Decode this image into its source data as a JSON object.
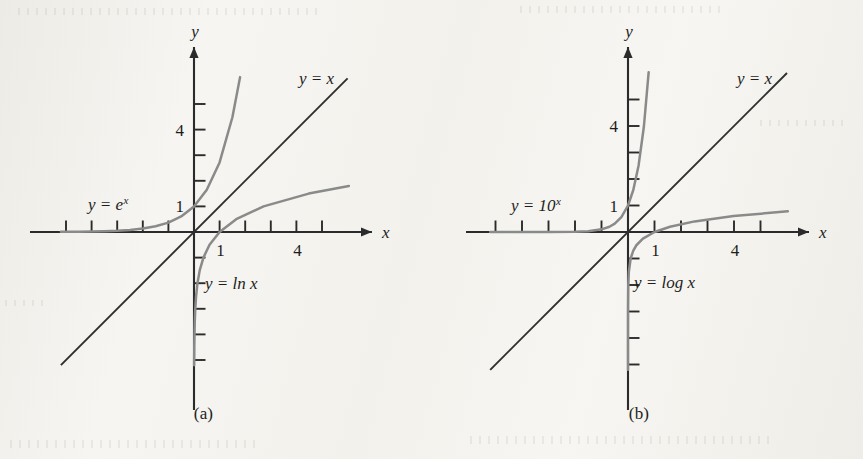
{
  "figure": {
    "colors": {
      "axis": "#2b2b2b",
      "identity_line": "#2f2f2f",
      "curve": "#8a8a8a",
      "text": "#1d1d1d",
      "paper": "#f7f6f2"
    }
  },
  "panels": [
    {
      "id": "a",
      "caption": "(a)",
      "axes": {
        "x_label": "x",
        "y_label": "y",
        "x_ticks": [
          -5,
          -4,
          -3,
          -2,
          -1,
          1,
          2,
          3,
          4,
          5
        ],
        "y_ticks": [
          -5,
          -4,
          -3,
          -2,
          -1,
          1,
          2,
          3,
          4,
          5
        ],
        "x_tick_labels": [
          {
            "value": 1,
            "text": "1"
          },
          {
            "value": 4,
            "text": "4"
          }
        ],
        "y_tick_labels": [
          {
            "value": 1,
            "text": "1"
          },
          {
            "value": 4,
            "text": "4"
          }
        ],
        "xlim": [
          -5.2,
          6.9
        ],
        "ylim": [
          -7.3,
          7.3
        ],
        "grid": false
      },
      "annotations": [
        {
          "name": "identity-line-label",
          "base": "y = x",
          "sup": ""
        },
        {
          "name": "exponential-curve-label",
          "base": "y = e",
          "sup": "x"
        },
        {
          "name": "logarithm-curve-label",
          "base": "y = ln x",
          "sup": ""
        }
      ]
    },
    {
      "id": "b",
      "caption": "(b)",
      "axes": {
        "x_label": "x",
        "y_label": "y",
        "x_ticks": [
          -5,
          -4,
          -3,
          -2,
          -1,
          1,
          2,
          3,
          4,
          5
        ],
        "y_ticks": [
          -5,
          -4,
          -3,
          -2,
          -1,
          1,
          2,
          3,
          4,
          5
        ],
        "x_tick_labels": [
          {
            "value": 1,
            "text": "1"
          },
          {
            "value": 4,
            "text": "4"
          }
        ],
        "y_tick_labels": [
          {
            "value": 1,
            "text": "1"
          },
          {
            "value": 4,
            "text": "4"
          }
        ],
        "xlim": [
          -5.2,
          6.9
        ],
        "ylim": [
          -7.3,
          7.3
        ],
        "grid": false
      },
      "annotations": [
        {
          "name": "identity-line-label",
          "base": "y = x",
          "sup": ""
        },
        {
          "name": "exponential-curve-label",
          "base": "y = 10",
          "sup": "x"
        },
        {
          "name": "logarithm-curve-label",
          "base": "y = log x",
          "sup": ""
        }
      ]
    }
  ],
  "chart_data": [
    {
      "type": "line",
      "panel": "a",
      "title": "y = e^x and y = ln x with y = x",
      "xlabel": "x",
      "ylabel": "y",
      "xlim": [
        -5.2,
        6.9
      ],
      "ylim": [
        -7.3,
        7.3
      ],
      "grid": false,
      "legend_position": "inline-annotations",
      "xticks": [
        -5,
        -4,
        -3,
        -2,
        -1,
        1,
        2,
        3,
        4,
        5
      ],
      "yticks": [
        -5,
        -4,
        -3,
        -2,
        -1,
        1,
        2,
        3,
        4,
        5
      ],
      "xtick_labels": {
        "1": "1",
        "4": "4"
      },
      "ytick_labels": {
        "1": "1",
        "4": "4"
      },
      "series": [
        {
          "name": "y = x",
          "color": "#2f2f2f",
          "x": [
            -5.2,
            6.0
          ],
          "y": [
            -5.2,
            6.0
          ]
        },
        {
          "name": "y = e^x",
          "color": "#8a8a8a",
          "x": [
            -5.2,
            -4.5,
            -4.0,
            -3.5,
            -3.0,
            -2.5,
            -2.0,
            -1.5,
            -1.0,
            -0.5,
            0.0,
            0.5,
            1.0,
            1.5,
            1.8
          ],
          "y": [
            0.0055,
            0.0111,
            0.0183,
            0.0302,
            0.0498,
            0.0821,
            0.1353,
            0.2231,
            0.3679,
            0.6065,
            1.0,
            1.6487,
            2.7183,
            4.4817,
            6.05
          ]
        },
        {
          "name": "y = ln x",
          "color": "#8a8a8a",
          "x": [
            0.0055,
            0.0111,
            0.0183,
            0.0302,
            0.0498,
            0.0821,
            0.1353,
            0.2231,
            0.3679,
            0.6065,
            1.0,
            1.6487,
            2.7183,
            4.4817,
            6.05
          ],
          "y": [
            -5.2,
            -4.5,
            -4.0,
            -3.5,
            -3.0,
            -2.5,
            -2.0,
            -1.5,
            -1.0,
            -0.5,
            0.0,
            0.5,
            1.0,
            1.5,
            1.8
          ]
        }
      ]
    },
    {
      "type": "line",
      "panel": "b",
      "title": "y = 10^x and y = log x with y = x",
      "xlabel": "x",
      "ylabel": "y",
      "xlim": [
        -5.2,
        6.9
      ],
      "ylim": [
        -7.3,
        7.3
      ],
      "grid": false,
      "legend_position": "inline-annotations",
      "xticks": [
        -5,
        -4,
        -3,
        -2,
        -1,
        1,
        2,
        3,
        4,
        5
      ],
      "yticks": [
        -5,
        -4,
        -3,
        -2,
        -1,
        1,
        2,
        3,
        4,
        5
      ],
      "xtick_labels": {
        "1": "1",
        "4": "4"
      },
      "ytick_labels": {
        "1": "1",
        "4": "4"
      },
      "series": [
        {
          "name": "y = x",
          "color": "#2f2f2f",
          "x": [
            -5.2,
            6.0
          ],
          "y": [
            -5.2,
            6.0
          ]
        },
        {
          "name": "y = 10^x",
          "color": "#8a8a8a",
          "x": [
            -5.2,
            -4.0,
            -3.0,
            -2.0,
            -1.5,
            -1.0,
            -0.7,
            -0.5,
            -0.25,
            0.0,
            0.2,
            0.4,
            0.6,
            0.78
          ],
          "y": [
            6.3e-06,
            0.0001,
            0.001,
            0.01,
            0.0316,
            0.1,
            0.1995,
            0.3162,
            0.5623,
            1.0,
            1.5849,
            2.5119,
            3.9811,
            6.03
          ]
        },
        {
          "name": "y = log x",
          "color": "#8a8a8a",
          "x": [
            6.3e-06,
            0.0001,
            0.001,
            0.01,
            0.0316,
            0.1,
            0.1995,
            0.3162,
            0.5623,
            1.0,
            1.5849,
            2.5119,
            3.9811,
            6.03
          ],
          "y": [
            -5.2,
            -4.0,
            -3.0,
            -2.0,
            -1.5,
            -1.0,
            -0.7,
            -0.5,
            -0.25,
            0.0,
            0.2,
            0.4,
            0.6,
            0.78
          ]
        }
      ]
    }
  ]
}
